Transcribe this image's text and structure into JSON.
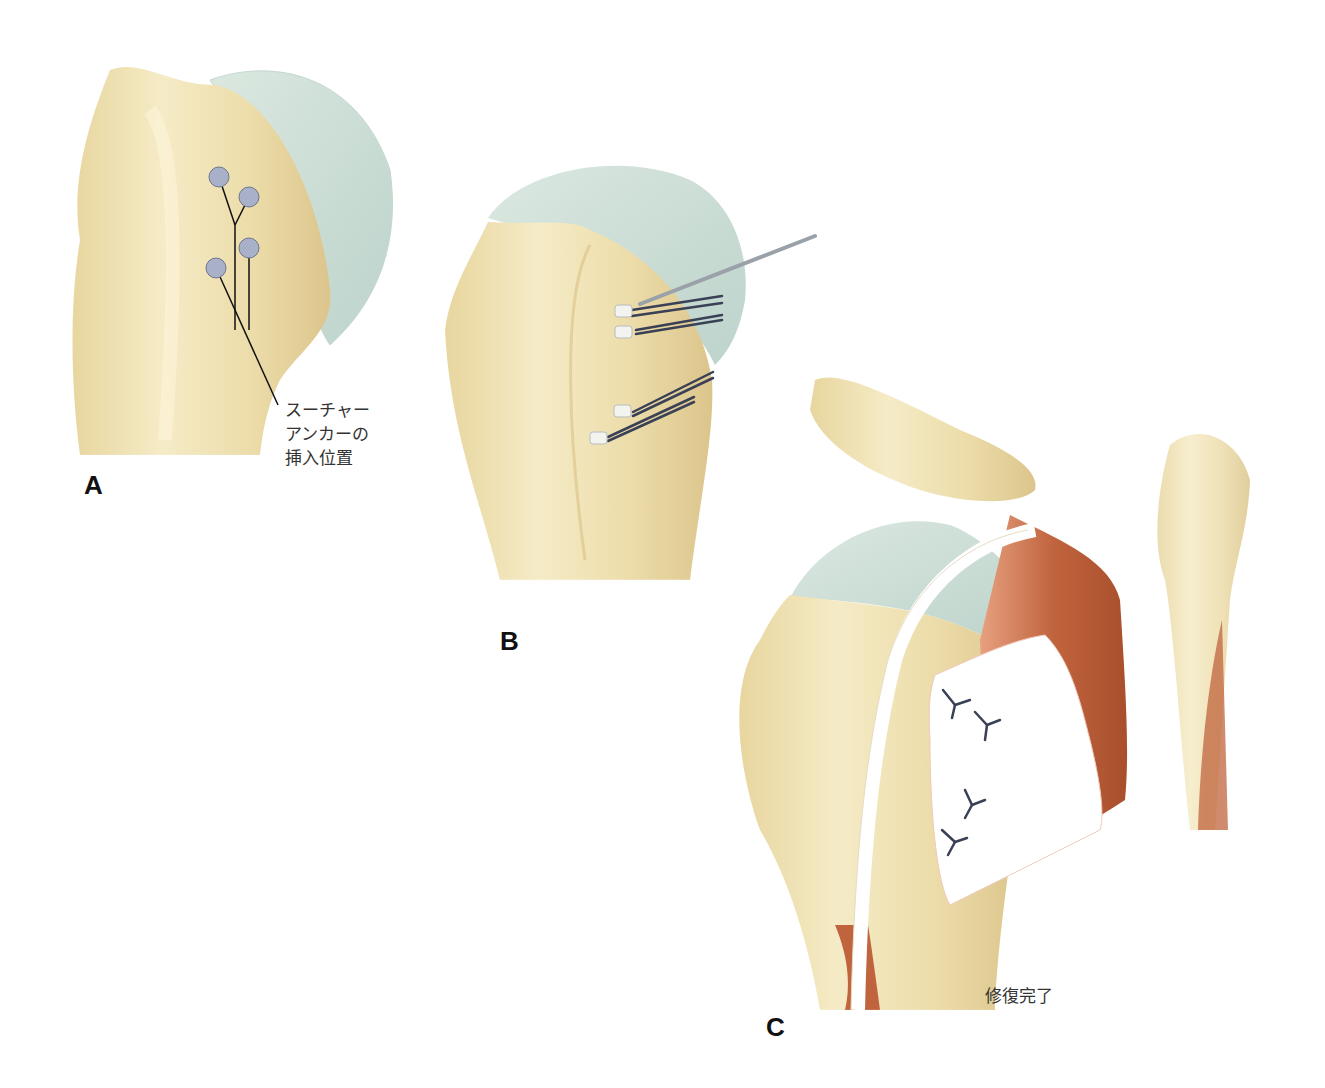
{
  "panels": [
    {
      "id": "A",
      "label": "A",
      "annotation": "スーチャー\nアンカーの\n挿入位置",
      "anchor_count": 4
    },
    {
      "id": "B",
      "label": "B",
      "anchor_count": 4
    },
    {
      "id": "C",
      "label": "C",
      "annotation": "修復完了",
      "stitch_count": 4
    }
  ],
  "colors": {
    "bone": "#f1e4b8",
    "bone_shade": "#e2cf98",
    "cartilage": "#cfe0d8",
    "anchor": "#a9b1c8",
    "muscle": "#c0643e",
    "tendon": "#ffffff",
    "suture": "#3a4055",
    "instrument": "#a7adb4"
  }
}
